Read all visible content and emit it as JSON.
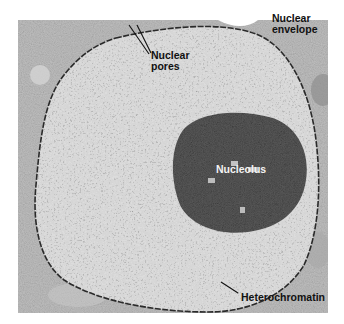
{
  "figure": {
    "colors": {
      "cytoplasm": "#bdbdbd",
      "nucleoplasm": "#d9d9d9",
      "nucleolus": "#555555",
      "envelope": "#2a2a2a",
      "label_dark": "#111111",
      "label_light": "#f4f4f4"
    },
    "labels": {
      "nuclear_pores_line1": "Nuclear",
      "nuclear_pores_line2": "pores",
      "nuclear_envelope_line1": "Nuclear",
      "nuclear_envelope_line2": "envelope",
      "nucleolus": "Nucleolus",
      "heterochromatin": "Heterochromatin"
    }
  }
}
